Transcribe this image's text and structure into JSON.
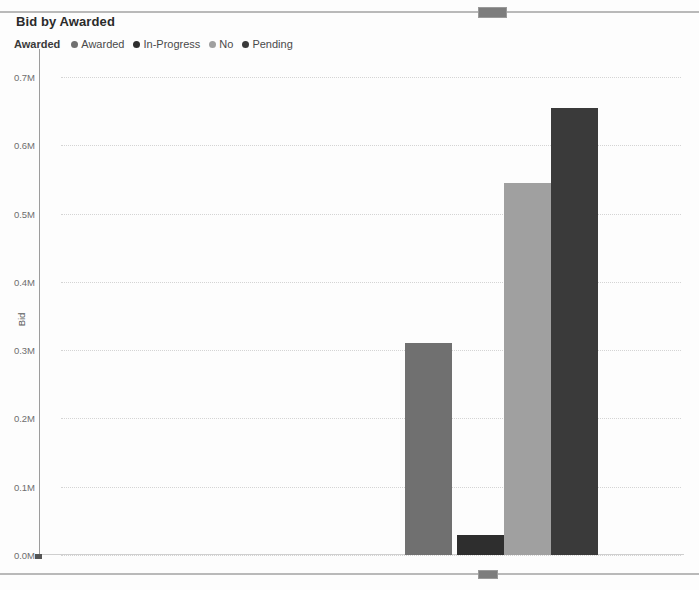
{
  "chart": {
    "title": "Bid by Awarded",
    "y_axis_title": "Bid",
    "legend_title": "Awarded"
  },
  "scrollbars": {
    "top_name": "horizontal-scrollbar-top",
    "bottom_name": "horizontal-scrollbar-bottom"
  },
  "chart_data": {
    "type": "bar",
    "title": "Bid by Awarded",
    "xlabel": "",
    "ylabel": "Bid",
    "ylim": [
      0,
      0.7
    ],
    "y_unit": "M",
    "grid": true,
    "legend_position": "top-left",
    "legend_title": "Awarded",
    "categories": [
      "Awarded",
      "In-Progress",
      "No",
      "Pending"
    ],
    "values": [
      0.31,
      0.03,
      0.545,
      0.655
    ],
    "value_labels": [
      "0.31M",
      "0.03M",
      "0.55M",
      "0.66M"
    ],
    "colors": [
      "#707070",
      "#2e2e2e",
      "#a0a0a0",
      "#3a3a3a"
    ],
    "yticks": [
      0.0,
      0.1,
      0.2,
      0.3,
      0.4,
      0.5,
      0.6,
      0.7
    ],
    "ytick_labels": [
      "0.0M",
      "0.1M",
      "0.2M",
      "0.3M",
      "0.4M",
      "0.5M",
      "0.6M",
      "0.7M"
    ],
    "legend": [
      {
        "label": "Awarded",
        "color": "#707070"
      },
      {
        "label": "In-Progress",
        "color": "#2e2e2e"
      },
      {
        "label": "No",
        "color": "#a0a0a0"
      },
      {
        "label": "Pending",
        "color": "#3a3a3a"
      }
    ]
  }
}
